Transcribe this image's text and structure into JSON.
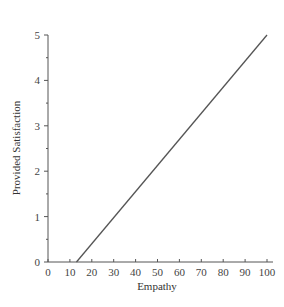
{
  "chart_data": {
    "type": "line",
    "title": "",
    "xlabel": "Empathy",
    "ylabel": "Provided Satisfaction",
    "xlim": [
      0,
      100
    ],
    "ylim": [
      0,
      5
    ],
    "xticks": [
      0,
      10,
      20,
      30,
      40,
      50,
      60,
      70,
      80,
      90,
      100
    ],
    "yticks": [
      0,
      1,
      2,
      3,
      4,
      5
    ],
    "grid": false,
    "legend": null,
    "series": [
      {
        "name": "Provided Satisfaction",
        "x": [
          13,
          100
        ],
        "y": [
          0,
          5
        ],
        "color": "#555555"
      }
    ]
  },
  "colors": {
    "axis": "#555555",
    "line": "#555555",
    "background": "#ffffff"
  }
}
